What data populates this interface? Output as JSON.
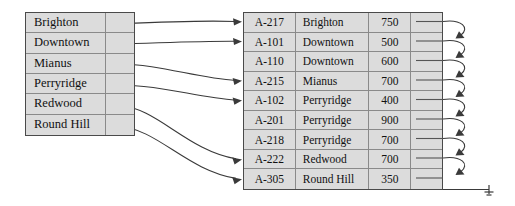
{
  "figure": {
    "name": "secondary-index-on-branch-name",
    "background": "#ffffff",
    "table_fill": "#dcdcdc",
    "border_color": "#4a4a4a",
    "line_color": "#3a3a3a"
  },
  "index_table": {
    "name": "index-table",
    "rows": [
      {
        "key": "Brighton",
        "pointer": "ptr"
      },
      {
        "key": "Downtown",
        "pointer": "ptr"
      },
      {
        "key": "Mianus",
        "pointer": "ptr"
      },
      {
        "key": "Perryridge",
        "pointer": "ptr"
      },
      {
        "key": "Redwood",
        "pointer": "ptr"
      },
      {
        "key": "Round Hill",
        "pointer": "ptr"
      }
    ]
  },
  "file_table": {
    "name": "account-file-table",
    "rows": [
      {
        "account": "A-217",
        "branch": "Brighton",
        "balance": "750",
        "pointer": "ptr"
      },
      {
        "account": "A-101",
        "branch": "Downtown",
        "balance": "500",
        "pointer": "ptr"
      },
      {
        "account": "A-110",
        "branch": "Downtown",
        "balance": "600",
        "pointer": "ptr"
      },
      {
        "account": "A-215",
        "branch": "Mianus",
        "balance": "700",
        "pointer": "ptr"
      },
      {
        "account": "A-102",
        "branch": "Perryridge",
        "balance": "400",
        "pointer": "ptr"
      },
      {
        "account": "A-201",
        "branch": "Perryridge",
        "balance": "900",
        "pointer": "ptr"
      },
      {
        "account": "A-218",
        "branch": "Perryridge",
        "balance": "700",
        "pointer": "ptr"
      },
      {
        "account": "A-222",
        "branch": "Redwood",
        "balance": "700",
        "pointer": "ptr"
      },
      {
        "account": "A-305",
        "branch": "Round Hill",
        "balance": "350",
        "pointer": "ptr"
      }
    ]
  },
  "links": [
    {
      "from_key": "Brighton",
      "from_row": 0,
      "to_row": 0
    },
    {
      "from_key": "Downtown",
      "from_row": 1,
      "to_row": 1
    },
    {
      "from_key": "Mianus",
      "from_row": 2,
      "to_row": 3
    },
    {
      "from_key": "Perryridge",
      "from_row": 3,
      "to_row": 4
    },
    {
      "from_key": "Redwood",
      "from_row": 4,
      "to_row": 7
    },
    {
      "from_key": "Round Hill",
      "from_row": 5,
      "to_row": 8
    }
  ],
  "chain": {
    "name": "bucket-chain-pointers",
    "description": "each file row pointer loops to the next row",
    "terminator": "ground-null-symbol",
    "links": 9
  }
}
